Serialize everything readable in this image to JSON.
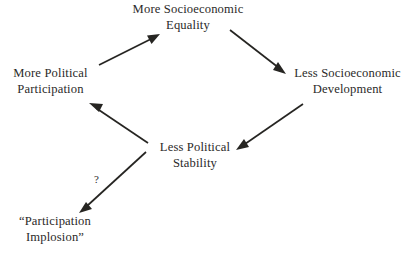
{
  "diagram": {
    "background_color": "#ffffff",
    "text_color": "#2b2a29",
    "arrow_color": "#262522",
    "nodes": [
      {
        "id": "equality",
        "line1": "More Socioeconomic",
        "line2": "Equality"
      },
      {
        "id": "participation",
        "line1": "More Political",
        "line2": "Participation"
      },
      {
        "id": "development",
        "line1": "Less Socioeconomic",
        "line2": "Development"
      },
      {
        "id": "stability",
        "line1": "Less Political",
        "line2": "Stability"
      },
      {
        "id": "implosion",
        "line1": "“Participation",
        "line2": "Implosion”"
      }
    ],
    "edges": [
      {
        "id": "participation-to-equality",
        "from": "More Political Participation",
        "to": "More Socioeconomic Equality",
        "label": ""
      },
      {
        "id": "equality-to-development",
        "from": "More Socioeconomic Equality",
        "to": "Less Socioeconomic Development",
        "label": ""
      },
      {
        "id": "development-to-stability",
        "from": "Less Socioeconomic Development",
        "to": "Less Political Stability",
        "label": ""
      },
      {
        "id": "stability-to-participation",
        "from": "Less Political Stability",
        "to": "More Political Participation",
        "label": ""
      },
      {
        "id": "stability-to-implosion",
        "from": "Less Political Stability",
        "to": "“Participation Implosion”",
        "label": "?"
      }
    ],
    "annotations": [
      {
        "id": "question-mark",
        "text": "?"
      }
    ]
  }
}
